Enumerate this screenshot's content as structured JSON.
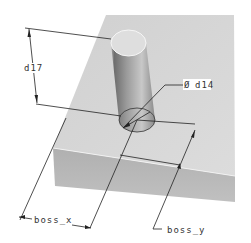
{
  "diagram": {
    "type": "cad-dimensioned-part",
    "colors": {
      "background": "#ffffff",
      "plate_top": "#d6d6d6",
      "plate_front": "#b8b8b8",
      "cylinder_light": "#d9d9d9",
      "cylinder_dark": "#7a7a7a",
      "dimension_line": "#222222",
      "edge_highlight": "#f4f4f4"
    },
    "dimensions": {
      "height": {
        "label": "d17"
      },
      "diameter": {
        "symbol": "Ø",
        "label": "d14"
      },
      "x_position": {
        "label": "boss_x"
      },
      "y_position": {
        "label": "boss_y"
      }
    }
  }
}
